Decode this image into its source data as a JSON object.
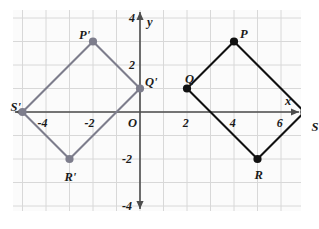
{
  "figure": {
    "kind": "coordinate-plane-diagram",
    "background": "#ffffff",
    "plot_background": "#fbfbfb",
    "grid_color": "#d8d8d8",
    "axis_color": "#4d4d4d",
    "preimage_color": "#111111",
    "image_color": "#7d7d8c"
  },
  "axes": {
    "x_label": "x",
    "y_label": "y",
    "origin_label": "O",
    "xlim": [
      -6,
      8
    ],
    "ylim": [
      -5,
      5
    ],
    "x_ticks": [
      {
        "value": -4,
        "label": "-4"
      },
      {
        "value": -2,
        "label": "-2"
      },
      {
        "value": 2,
        "label": "2"
      },
      {
        "value": 4,
        "label": "4"
      },
      {
        "value": 6,
        "label": "6"
      }
    ],
    "y_ticks": [
      {
        "value": 4,
        "label": "4"
      },
      {
        "value": 2,
        "label": "2"
      },
      {
        "value": -2,
        "label": "-2"
      },
      {
        "value": -4,
        "label": "-4"
      }
    ]
  },
  "chart_data": {
    "type": "scatter",
    "title": "",
    "xlabel": "x",
    "ylabel": "y",
    "xlim": [
      -6,
      8
    ],
    "ylim": [
      -5,
      5
    ],
    "grid": true,
    "legend": "none",
    "series": [
      {
        "name": "PQRS",
        "role": "preimage",
        "color": "#111111",
        "closed": true,
        "vertices": [
          {
            "label": "P",
            "x": 4,
            "y": 3,
            "label_dx": 6,
            "label_dy": -14
          },
          {
            "label": "Q",
            "x": 2,
            "y": 1,
            "label_dx": -2,
            "label_dy": -16
          },
          {
            "label": "R",
            "x": 5,
            "y": -2,
            "label_dx": -3,
            "label_dy": 10
          },
          {
            "label": "S",
            "x": 7,
            "y": 0,
            "label_dx": 7,
            "label_dy": 9
          }
        ]
      },
      {
        "name": "P'Q'R'S'",
        "role": "image",
        "color": "#7d7d8c",
        "closed": true,
        "vertices": [
          {
            "label": "P'",
            "x": -2,
            "y": 3,
            "label_dx": -14,
            "label_dy": -13
          },
          {
            "label": "Q'",
            "x": 0,
            "y": 1,
            "label_dx": 5,
            "label_dy": -13
          },
          {
            "label": "R'",
            "x": -3,
            "y": -2,
            "label_dx": -5,
            "label_dy": 12
          },
          {
            "label": "S'",
            "x": -5,
            "y": 0,
            "label_dx": -12,
            "label_dy": -11
          }
        ]
      }
    ]
  }
}
